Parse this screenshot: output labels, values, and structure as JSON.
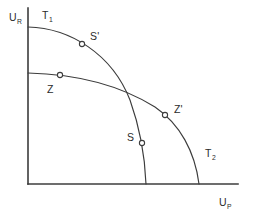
{
  "figure": {
    "kind": "line-diagram",
    "background_color": "#ffffff",
    "ink_color": "#3c3c3c"
  },
  "axes": {
    "y_axis": {
      "name": "vertical-axis",
      "label_base": "U",
      "label_sub": "R",
      "x": 28,
      "y_top": 8,
      "y_bottom": 184
    },
    "x_axis": {
      "name": "horizontal-axis",
      "label_base": "U",
      "label_sub": "P",
      "y": 184,
      "x_left": 28,
      "x_right": 238
    }
  },
  "curves": [
    {
      "id": "T1",
      "label_base": "T",
      "label_sub": "1",
      "label_x": 42,
      "label_y": 19,
      "description": "outer transformation frontier",
      "path": "M 28,27 C 70,28 112,54 130,100 C 140,128 145,158 146,184",
      "start": [
        28,
        27
      ],
      "end": [
        146,
        184
      ]
    },
    {
      "id": "T2",
      "label_base": "T",
      "label_sub": "2",
      "label_x": 205,
      "label_y": 157,
      "description": "lower-flatter frontier through Z and Z'",
      "path": "M 28,73 C 72,74 118,84 155,107 C 180,124 195,152 199,184",
      "start": [
        28,
        73
      ],
      "end": [
        199,
        184
      ]
    }
  ],
  "points": [
    {
      "id": "S-prime",
      "label": "S'",
      "marker_x": 82,
      "marker_y": 44,
      "label_x": 90,
      "label_y": 40
    },
    {
      "id": "Z",
      "label": "Z",
      "marker_x": 60,
      "marker_y": 75,
      "label_x": 47,
      "label_y": 93
    },
    {
      "id": "Z-prime",
      "label": "Z'",
      "marker_x": 165,
      "marker_y": 115,
      "label_x": 174,
      "label_y": 113
    },
    {
      "id": "S",
      "label": "S",
      "marker_x": 142,
      "marker_y": 143,
      "label_x": 127,
      "label_y": 141
    }
  ],
  "labels": {
    "y_axis_label": "U",
    "y_axis_subscript": "R",
    "x_axis_label": "U",
    "x_axis_subscript": "P",
    "t1": "T",
    "t1_subscript": "1",
    "t2": "T",
    "t2_subscript": "2",
    "s_prime": "S'",
    "z": "Z",
    "z_prime": "Z'",
    "s": "S"
  },
  "chart_data": {
    "type": "line",
    "title": "",
    "xlabel": "U_P",
    "ylabel": "U_R",
    "grid": false,
    "legend": "none",
    "axis_ticks": [],
    "series": [
      {
        "name": "T1",
        "description": "concave frontier from y-axis intercept down to x-axis",
        "x": [
          0,
          20,
          40,
          60,
          80,
          100,
          118
        ],
        "y": [
          157,
          154,
          146,
          130,
          103,
          62,
          0
        ]
      },
      {
        "name": "T2",
        "description": "flatter concave frontier lying below T1 near the y-axis and above it near the x-axis",
        "x": [
          0,
          30,
          60,
          90,
          120,
          150,
          171
        ],
        "y": [
          111,
          108,
          101,
          89,
          71,
          43,
          0
        ]
      }
    ],
    "annotated_points": [
      {
        "label": "S'",
        "series": "T1",
        "x": 54,
        "y": 140
      },
      {
        "label": "Z",
        "series": "T2",
        "x": 32,
        "y": 109
      },
      {
        "label": "Z'",
        "series": "T2",
        "x": 137,
        "y": 69
      },
      {
        "label": "S",
        "series": "T1",
        "x": 114,
        "y": 41
      }
    ],
    "xlim": [
      0,
      210
    ],
    "ylim": [
      0,
      176
    ]
  }
}
